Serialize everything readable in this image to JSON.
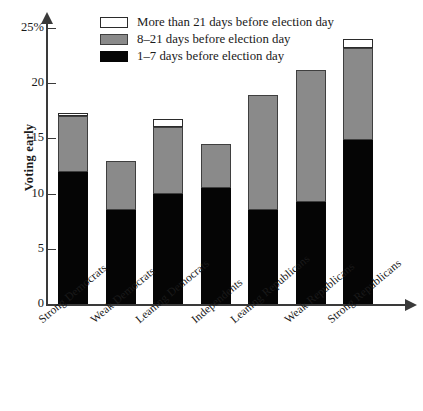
{
  "chart_data": {
    "type": "bar",
    "subtype": "stacked-bar",
    "title": "",
    "xlabel": "",
    "ylabel": "Voting early",
    "ylim": [
      0,
      25
    ],
    "yticks": [
      0,
      5,
      10,
      15,
      20,
      25
    ],
    "ytick_labels": [
      "0",
      "5",
      "10",
      "15",
      "20",
      "25%"
    ],
    "grid": false,
    "legend_position": "top-left",
    "categories": [
      "Strong Democrats",
      "Weak Democrats",
      "Leaning Democrats",
      "Independents",
      "Leaning Republicans",
      "Weak Republicans",
      "Strong Republicans"
    ],
    "series": [
      {
        "name": "1–7 days before election day",
        "color": "#050505",
        "values": [
          12.0,
          8.5,
          10.0,
          10.5,
          8.5,
          9.2,
          14.9
        ]
      },
      {
        "name": "8–21 days before election day",
        "color": "#8a8a8a",
        "values": [
          5.0,
          4.5,
          6.0,
          4.0,
          10.4,
          12.0,
          8.3
        ]
      },
      {
        "name": "More than 21 days before election day",
        "color": "#ffffff",
        "values": [
          0.3,
          0.0,
          0.8,
          0.0,
          0.0,
          0.0,
          0.8
        ]
      }
    ],
    "totals": [
      17.3,
      13.0,
      16.8,
      14.5,
      18.9,
      21.2,
      24.0
    ]
  },
  "legend": {
    "items": [
      {
        "label": "More than 21 days before election day",
        "swatch": "white-swatch"
      },
      {
        "label": "8–21 days before election day",
        "swatch": "gray-swatch"
      },
      {
        "label": "1–7 days before election day",
        "swatch": "black-swatch"
      }
    ]
  },
  "axis": {
    "y_title": "Voting early"
  }
}
